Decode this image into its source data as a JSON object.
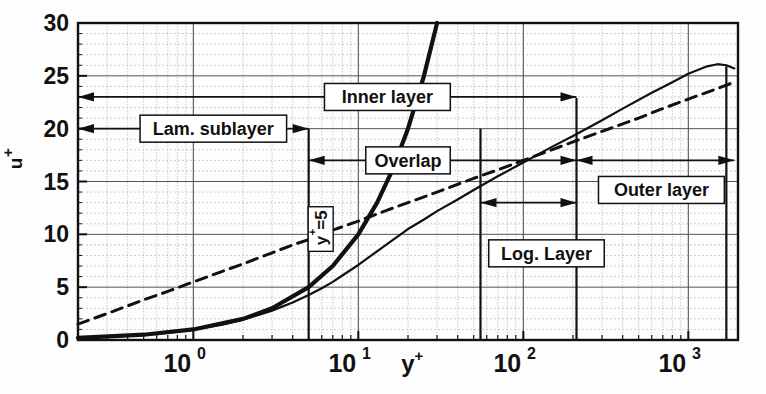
{
  "chart_data": {
    "type": "line",
    "title": "",
    "xlabel": "y+",
    "ylabel": "u+",
    "xscale": "log",
    "xlim": [
      0.2,
      2000
    ],
    "ylim": [
      0,
      30
    ],
    "grid": true,
    "legend_position": "none",
    "xticks": [
      {
        "value": 1,
        "label": "10",
        "exp": "0"
      },
      {
        "value": 10,
        "label": "10",
        "exp": "1"
      },
      {
        "value": 100,
        "label": "10",
        "exp": "2"
      },
      {
        "value": 1000,
        "label": "10",
        "exp": "3"
      }
    ],
    "yticks": [
      0,
      5,
      10,
      15,
      20,
      25,
      30
    ],
    "series": [
      {
        "name": "Velocity profile u+",
        "style": "solid",
        "points": [
          [
            0.2,
            0.2
          ],
          [
            0.3,
            0.3
          ],
          [
            0.5,
            0.5
          ],
          [
            0.7,
            0.69
          ],
          [
            1.0,
            0.99
          ],
          [
            1.5,
            1.45
          ],
          [
            2.0,
            1.92
          ],
          [
            3.0,
            2.78
          ],
          [
            4.0,
            3.55
          ],
          [
            5.0,
            4.25
          ],
          [
            6.0,
            4.9
          ],
          [
            7.0,
            5.5
          ],
          [
            8.0,
            6.1
          ],
          [
            10.0,
            7.1
          ],
          [
            12.0,
            8.0
          ],
          [
            15.0,
            9.1
          ],
          [
            20.0,
            10.5
          ],
          [
            25.0,
            11.4
          ],
          [
            30.0,
            12.2
          ],
          [
            40.0,
            13.3
          ],
          [
            50.0,
            14.2
          ],
          [
            70.0,
            15.5
          ],
          [
            100.0,
            16.8
          ],
          [
            150.0,
            18.3
          ],
          [
            200.0,
            19.3
          ],
          [
            300.0,
            20.8
          ],
          [
            400.0,
            21.9
          ],
          [
            600.0,
            23.4
          ],
          [
            800.0,
            24.4
          ],
          [
            1000.0,
            25.2
          ],
          [
            1300.0,
            25.9
          ],
          [
            1500.0,
            26.1
          ],
          [
            1700.0,
            26.0
          ],
          [
            1900.0,
            25.7
          ]
        ]
      },
      {
        "name": "Log law 2.5 ln(y+)+5.5",
        "style": "dashed",
        "points": [
          [
            0.2,
            1.5
          ],
          [
            0.3,
            2.5
          ],
          [
            0.5,
            3.8
          ],
          [
            0.7,
            4.6
          ],
          [
            1.0,
            5.5
          ],
          [
            1.5,
            6.5
          ],
          [
            2.0,
            7.2
          ],
          [
            3.0,
            8.25
          ],
          [
            4.0,
            9.0
          ],
          [
            5.0,
            9.5
          ],
          [
            7.0,
            10.4
          ],
          [
            10.0,
            11.25
          ],
          [
            15.0,
            12.3
          ],
          [
            20.0,
            13.0
          ],
          [
            30.0,
            14.0
          ],
          [
            50.0,
            15.3
          ],
          [
            70.0,
            16.1
          ],
          [
            100.0,
            17.0
          ],
          [
            200.0,
            18.75
          ],
          [
            300.0,
            19.75
          ],
          [
            500.0,
            21.0
          ],
          [
            700.0,
            21.9
          ],
          [
            1000.0,
            22.8
          ],
          [
            1500.0,
            23.8
          ],
          [
            1900.0,
            24.4
          ]
        ]
      },
      {
        "name": "Linear law u+ = y+",
        "style": "solid-thick",
        "points": [
          [
            0.2,
            0.2
          ],
          [
            0.5,
            0.5
          ],
          [
            1.0,
            1.0
          ],
          [
            2.0,
            2.0
          ],
          [
            3.0,
            3.0
          ],
          [
            5.0,
            5.0
          ],
          [
            7.0,
            7.0
          ],
          [
            10.0,
            10.0
          ],
          [
            13.0,
            13.0
          ],
          [
            16.0,
            16.0
          ],
          [
            20.0,
            20.0
          ],
          [
            25.0,
            25.0
          ],
          [
            30.0,
            30.0
          ]
        ]
      }
    ],
    "vertical_markers": [
      {
        "name": "y-plus-5",
        "value": 5,
        "y_from": 0,
        "y_to": 20
      },
      {
        "name": "log-layer-start",
        "value": 55,
        "y_from": 0,
        "y_to": 20
      },
      {
        "name": "log-layer-end",
        "value": 210,
        "y_from": 0,
        "y_to": 22.9
      },
      {
        "name": "outer-edge",
        "value": 1700,
        "y_from": 0,
        "y_to": 25.9
      }
    ],
    "annotations": [
      {
        "name": "inner-layer",
        "label": "Inner layer",
        "u_level": 23,
        "span_from": 0.2,
        "span_to": 210
      },
      {
        "name": "lam-sublayer",
        "label": "Lam. sublayer",
        "u_level": 20,
        "span_from": 0.2,
        "span_to": 5
      },
      {
        "name": "overlap",
        "label": "Overlap",
        "u_level": 17,
        "span_from": 5,
        "span_to": 210
      },
      {
        "name": "log-layer",
        "label": "Log. Layer",
        "u_level": 13,
        "span_from": 55,
        "span_to": 210
      },
      {
        "name": "outer-layer",
        "label": "Outer layer",
        "u_level": 17,
        "span_from": 210,
        "span_to": 1700
      },
      {
        "name": "y-plus-5-marker",
        "label": "y⁺=5",
        "rotated": true
      }
    ]
  },
  "axis": {
    "y_title": "u",
    "y_title_sup": "+",
    "x_title": "y",
    "x_title_sup": "+",
    "y_tick_labels": [
      "30",
      "25",
      "20",
      "15",
      "10",
      "5",
      "0"
    ]
  },
  "labels": {
    "inner_layer": "Inner layer",
    "lam_sublayer": "Lam. sublayer",
    "overlap": "Overlap",
    "log_layer": "Log. Layer",
    "outer_layer": "Outer layer",
    "y_plus_5": "y",
    "y_plus_5_sup": "+",
    "y_plus_5_eq": "=5"
  },
  "colors": {
    "line": "#111111",
    "grid_major": "#555555",
    "grid_minor": "#9aa2aa",
    "background": "#fdfdfd",
    "text": "#111111"
  }
}
